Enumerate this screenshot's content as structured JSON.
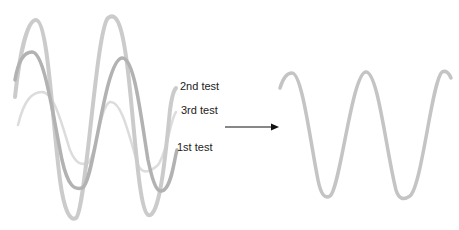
{
  "diagram": {
    "left_group": {
      "description": "Three overlapping, misaligned sine-like trial waveforms",
      "curves": [
        {
          "id": "2nd",
          "label": "2nd test",
          "color": "#c8c8c8",
          "width": 4
        },
        {
          "id": "3rd",
          "label": "3rd test",
          "color": "#dcdcdc",
          "width": 2.5
        },
        {
          "id": "1st",
          "label": "1st test",
          "color": "#b0b0b0",
          "width": 3.5
        }
      ]
    },
    "arrow": {
      "direction": "right",
      "color": "#111111"
    },
    "right_group": {
      "description": "Single aligned/averaged waveform",
      "color": "#bdbdbd"
    }
  },
  "labels": {
    "second": "2nd test",
    "third": "3rd test",
    "first": "1st test"
  }
}
